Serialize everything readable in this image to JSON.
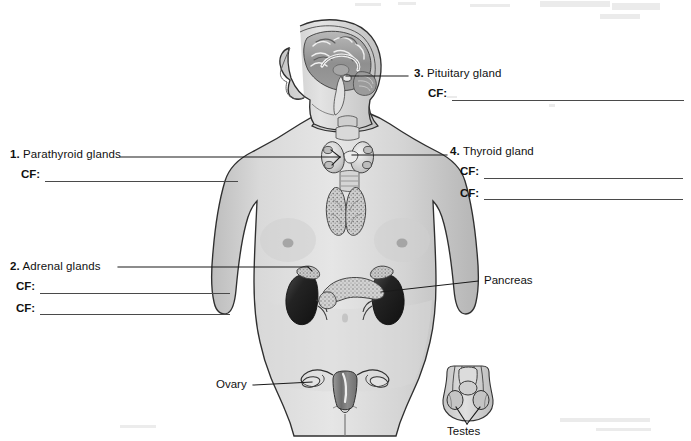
{
  "figure": {
    "background_color": "#ffffff",
    "body_fill": "#d8d8d8",
    "organ_dark": "#2b2b2b",
    "line_color": "#1a1a1a",
    "blank_line_color": "#4a4a4a"
  },
  "labels": {
    "parathyroid": {
      "number": "1.",
      "name": "Parathyroid glands",
      "cf_tag": "CF:",
      "cf_count": 1
    },
    "adrenal": {
      "number": "2.",
      "name": "Adrenal glands",
      "cf_tag": "CF:",
      "cf_count": 2
    },
    "pituitary": {
      "number": "3.",
      "name": "Pituitary gland",
      "cf_tag": "CF:",
      "cf_count": 1
    },
    "thyroid": {
      "number": "4.",
      "name": "Thyroid gland",
      "cf_tag": "CF:",
      "cf_count": 2
    },
    "pancreas": {
      "name": "Pancreas"
    },
    "ovary": {
      "name": "Ovary"
    },
    "testes": {
      "name": "Testes"
    }
  }
}
